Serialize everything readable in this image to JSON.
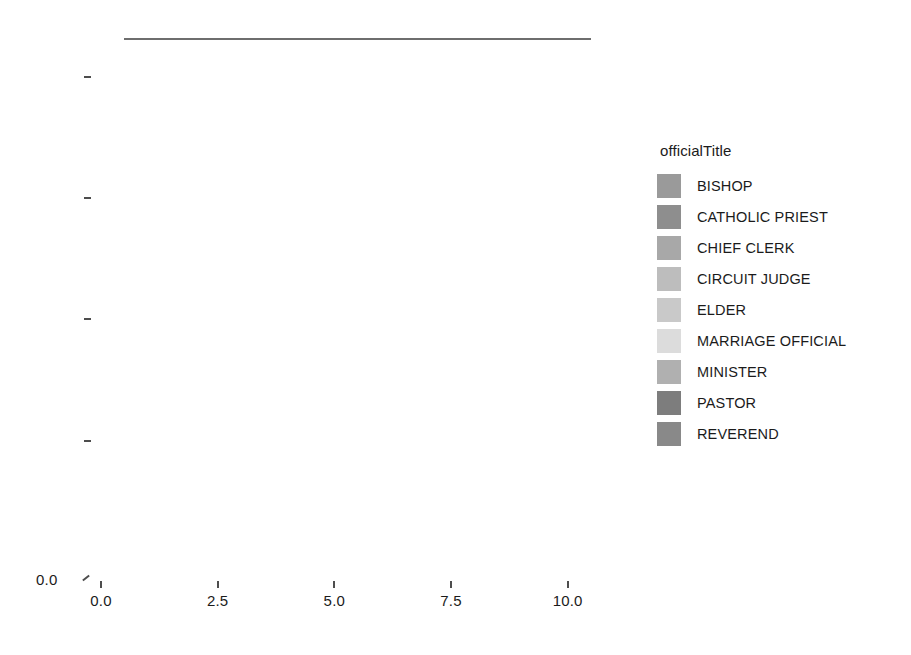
{
  "chart_data": {
    "type": "heatmap",
    "title": "",
    "xlabel": "",
    "ylabel": "",
    "xlim": [
      0.0,
      10.8
    ],
    "ylim": [
      0.0,
      10.8
    ],
    "xticks": [
      "0.0",
      "2.5",
      "5.0",
      "7.5",
      "10.0"
    ],
    "xtick_values": [
      0.0,
      2.5,
      5.0,
      7.5,
      10.0
    ],
    "yticks": [
      "0.0",
      "2.5",
      "5.0",
      "7.5",
      "10.0"
    ],
    "ytick_values": [
      0.0,
      2.5,
      5.0,
      7.5,
      10.0
    ],
    "grid": true,
    "legend_position": "right",
    "legend_title": "officialTitle",
    "cell_size": 1.0,
    "x_centers": [
      1.0,
      2.0,
      3.0,
      4.0,
      5.0,
      6.0,
      7.0,
      8.0,
      9.0,
      10.0
    ],
    "y_centers": [
      1.0,
      2.0,
      3.0,
      4.0,
      5.0,
      6.0,
      7.0,
      8.0,
      9.0,
      10.0
    ],
    "categories": [
      "BISHOP",
      "CATHOLIC PRIEST",
      "CHIEF CLERK",
      "CIRCUIT JUDGE",
      "ELDER",
      "MARRIAGE OFFICIAL",
      "MINISTER",
      "PASTOR",
      "REVEREND"
    ],
    "category_colors": [
      "#9a9a9a",
      "#8e8e8e",
      "#a8a8a8",
      "#bdbdbd",
      "#c9c9c9",
      "#dcdcdc",
      "#b0b0b0",
      "#7d7d7d",
      "#898989"
    ],
    "note": "Grid of 1x1 tiles coloured by officialTitle category. Rows are indexed by y centre (1..10, bottom to top); columns by x centre (1..10, left to right). Missing tiles are blank (white).",
    "rows": [
      {
        "y": 10.0,
        "cells": [
          {
            "x": 1.0,
            "category": "ELDER"
          },
          {
            "x": 2.0,
            "category": "ELDER"
          },
          {
            "x": 3.0,
            "category": "ELDER"
          },
          {
            "x": 4.0,
            "category": "ELDER"
          },
          {
            "x": 5.0,
            "category": "ELDER"
          },
          {
            "x": 6.0,
            "category": "MINISTER"
          },
          {
            "x": 7.0,
            "category": "MINISTER"
          },
          {
            "x": 8.0,
            "category": "PASTOR"
          },
          {
            "x": 9.0,
            "category": "REVEREND"
          },
          {
            "x": 10.0,
            "category": null
          }
        ]
      },
      {
        "y": 9.0,
        "cells": [
          {
            "x": 1.0,
            "category": "CIRCUIT JUDGE"
          },
          {
            "x": 2.0,
            "category": "ELDER"
          },
          {
            "x": 3.0,
            "category": "ELDER"
          },
          {
            "x": 4.0,
            "category": "ELDER"
          },
          {
            "x": 5.0,
            "category": "ELDER"
          },
          {
            "x": 6.0,
            "category": "MINISTER"
          },
          {
            "x": 7.0,
            "category": "MINISTER"
          },
          {
            "x": 8.0,
            "category": "PASTOR"
          },
          {
            "x": 9.0,
            "category": "REVEREND"
          },
          {
            "x": 10.0,
            "category": null
          }
        ]
      },
      {
        "y": 8.0,
        "cells": [
          {
            "x": 1.0,
            "category": "MINISTER"
          },
          {
            "x": 2.0,
            "category": "ELDER"
          },
          {
            "x": 3.0,
            "category": "ELDER"
          },
          {
            "x": 4.0,
            "category": "ELDER"
          },
          {
            "x": 5.0,
            "category": "ELDER"
          },
          {
            "x": 6.0,
            "category": "MINISTER"
          },
          {
            "x": 7.0,
            "category": "MINISTER"
          },
          {
            "x": 8.0,
            "category": "PASTOR"
          },
          {
            "x": 9.0,
            "category": "REVEREND"
          },
          {
            "x": 10.0,
            "category": "REVEREND"
          }
        ]
      },
      {
        "y": 7.0,
        "cells": [
          {
            "x": 1.0,
            "category": "CIRCUIT JUDGE"
          },
          {
            "x": 2.0,
            "category": "ELDER"
          },
          {
            "x": 3.0,
            "category": "ELDER"
          },
          {
            "x": 4.0,
            "category": "ELDER"
          },
          {
            "x": 5.0,
            "category": "ELDER"
          },
          {
            "x": 6.0,
            "category": "MINISTER"
          },
          {
            "x": 7.0,
            "category": "MINISTER"
          },
          {
            "x": 8.0,
            "category": "PASTOR"
          },
          {
            "x": 9.0,
            "category": "REVEREND"
          },
          {
            "x": 10.0,
            "category": "REVEREND"
          }
        ]
      },
      {
        "y": 6.0,
        "cells": [
          {
            "x": 1.0,
            "category": "CHIEF CLERK"
          },
          {
            "x": 2.0,
            "category": "ELDER"
          },
          {
            "x": 3.0,
            "category": "ELDER"
          },
          {
            "x": 4.0,
            "category": "ELDER"
          },
          {
            "x": 5.0,
            "category": "ELDER"
          },
          {
            "x": 6.0,
            "category": "MINISTER"
          },
          {
            "x": 7.0,
            "category": "MINISTER"
          },
          {
            "x": 8.0,
            "category": "PASTOR"
          },
          {
            "x": 9.0,
            "category": "REVEREND"
          },
          {
            "x": 10.0,
            "category": "REVEREND"
          }
        ]
      },
      {
        "y": 5.0,
        "cells": [
          {
            "x": 1.0,
            "category": "CHIEF CLERK"
          },
          {
            "x": 2.0,
            "category": "ELDER"
          },
          {
            "x": 3.0,
            "category": "ELDER"
          },
          {
            "x": 4.0,
            "category": "ELDER"
          },
          {
            "x": 5.0,
            "category": "ELDER"
          },
          {
            "x": 6.0,
            "category": "MINISTER"
          },
          {
            "x": 7.0,
            "category": "MINISTER"
          },
          {
            "x": 8.0,
            "category": "PASTOR"
          },
          {
            "x": 9.0,
            "category": "REVEREND"
          },
          {
            "x": 10.0,
            "category": "REVEREND"
          }
        ]
      },
      {
        "y": 4.0,
        "cells": [
          {
            "x": 1.0,
            "category": "CATHOLIC PRIEST"
          },
          {
            "x": 2.0,
            "category": "MARRIAGE OFFICIAL"
          },
          {
            "x": 3.0,
            "category": "MARRIAGE OFFICIAL"
          },
          {
            "x": 4.0,
            "category": "MARRIAGE OFFICIAL"
          },
          {
            "x": 5.0,
            "category": "MARRIAGE OFFICIAL"
          },
          {
            "x": 6.0,
            "category": "MARRIAGE OFFICIAL"
          },
          {
            "x": 7.0,
            "category": "MINISTER"
          },
          {
            "x": 8.0,
            "category": "MINISTER"
          },
          {
            "x": 9.0,
            "category": "REVEREND"
          },
          {
            "x": 10.0,
            "category": "REVEREND"
          }
        ]
      },
      {
        "y": 3.0,
        "cells": [
          {
            "x": 1.0,
            "category": "CATHOLIC PRIEST"
          },
          {
            "x": 2.0,
            "category": "MARRIAGE OFFICIAL"
          },
          {
            "x": 3.0,
            "category": "MARRIAGE OFFICIAL"
          },
          {
            "x": 4.0,
            "category": "MARRIAGE OFFICIAL"
          },
          {
            "x": 5.0,
            "category": "MARRIAGE OFFICIAL"
          },
          {
            "x": 6.0,
            "category": "MARRIAGE OFFICIAL"
          },
          {
            "x": 7.0,
            "category": "MINISTER"
          },
          {
            "x": 8.0,
            "category": "MINISTER"
          },
          {
            "x": 9.0,
            "category": "REVEREND"
          },
          {
            "x": 10.0,
            "category": "REVEREND"
          }
        ]
      },
      {
        "y": 2.0,
        "cells": [
          {
            "x": 1.0,
            "category": "CATHOLIC PRIEST"
          },
          {
            "x": 2.0,
            "category": "MARRIAGE OFFICIAL"
          },
          {
            "x": 3.0,
            "category": "MARRIAGE OFFICIAL"
          },
          {
            "x": 4.0,
            "category": "MARRIAGE OFFICIAL"
          },
          {
            "x": 5.0,
            "category": "MARRIAGE OFFICIAL"
          },
          {
            "x": 6.0,
            "category": "MARRIAGE OFFICIAL"
          },
          {
            "x": 7.0,
            "category": "MINISTER"
          },
          {
            "x": 8.0,
            "category": "MINISTER"
          },
          {
            "x": 9.0,
            "category": "REVEREND"
          },
          {
            "x": 10.0,
            "category": "REVEREND"
          }
        ]
      },
      {
        "y": 1.0,
        "cells": [
          {
            "x": 1.0,
            "category": "CATHOLIC PRIEST"
          },
          {
            "x": 2.0,
            "category": "MARRIAGE OFFICIAL"
          },
          {
            "x": 3.0,
            "category": "MARRIAGE OFFICIAL"
          },
          {
            "x": 4.0,
            "category": "MARRIAGE OFFICIAL"
          },
          {
            "x": 5.0,
            "category": "MARRIAGE OFFICIAL"
          },
          {
            "x": 6.0,
            "category": "MARRIAGE OFFICIAL"
          },
          {
            "x": 7.0,
            "category": "MINISTER"
          },
          {
            "x": 8.0,
            "category": "MINISTER"
          },
          {
            "x": 9.0,
            "category": "REVEREND"
          },
          {
            "x": 10.0,
            "category": "REVEREND"
          }
        ]
      }
    ]
  },
  "axes": {
    "origin_label": "0.0"
  },
  "legend": {
    "title": "officialTitle",
    "items": [
      {
        "label": "BISHOP",
        "color": "#9a9a9a"
      },
      {
        "label": "CATHOLIC PRIEST",
        "color": "#8e8e8e"
      },
      {
        "label": "CHIEF CLERK",
        "color": "#a8a8a8"
      },
      {
        "label": "CIRCUIT JUDGE",
        "color": "#bdbdbd"
      },
      {
        "label": "ELDER",
        "color": "#c9c9c9"
      },
      {
        "label": "MARRIAGE OFFICIAL",
        "color": "#dcdcdc"
      },
      {
        "label": "MINISTER",
        "color": "#b0b0b0"
      },
      {
        "label": "PASTOR",
        "color": "#7d7d7d"
      },
      {
        "label": "REVEREND",
        "color": "#898989"
      }
    ]
  },
  "style": {
    "background": "#ffffff",
    "cell_border": "#6e6e6e",
    "text": "#1b1b1b"
  }
}
